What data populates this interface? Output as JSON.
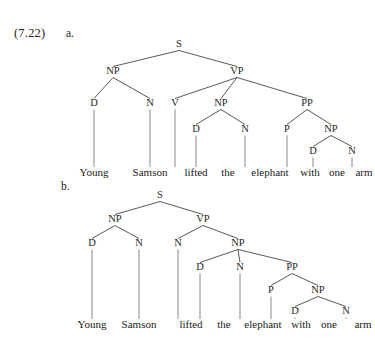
{
  "example": {
    "number_label": "(7.22)",
    "items": [
      {
        "letter": "a."
      },
      {
        "letter": "b."
      }
    ]
  },
  "sentence": {
    "words": [
      "Young",
      "Samson",
      "lifted",
      "the",
      "elephant",
      "with",
      "one",
      "arm"
    ]
  },
  "style": {
    "background": "#ffffff",
    "line_color": "#3b3b3b",
    "text_color": "#1f1f1f"
  },
  "trees": [
    {
      "id": "tree-a",
      "caption_letter": "a.",
      "description": "PP attached high to VP",
      "word_baseline_y": 158,
      "words": [
        {
          "text": "Young",
          "x": 94
        },
        {
          "text": "Samson",
          "x": 150
        },
        {
          "text": "lifted",
          "x": 196
        },
        {
          "text": "the",
          "x": 228
        },
        {
          "text": "elephant",
          "x": 270
        },
        {
          "text": "with",
          "x": 310
        },
        {
          "text": "one",
          "x": 337
        },
        {
          "text": "arm",
          "x": 364
        }
      ],
      "nodes": [
        {
          "id": "S",
          "label": "S",
          "x": 179,
          "y": 29
        },
        {
          "id": "NP1",
          "label": "NP",
          "x": 113,
          "y": 56
        },
        {
          "id": "VP",
          "label": "VP",
          "x": 237,
          "y": 56
        },
        {
          "id": "D1",
          "label": "D",
          "x": 94,
          "y": 88
        },
        {
          "id": "N1",
          "label": "N",
          "x": 150,
          "y": 88
        },
        {
          "id": "V",
          "label": "V",
          "x": 175,
          "y": 88
        },
        {
          "id": "NP2",
          "label": "NP",
          "x": 221,
          "y": 88
        },
        {
          "id": "PP",
          "label": "PP",
          "x": 307,
          "y": 88
        },
        {
          "id": "D2",
          "label": "D",
          "x": 196,
          "y": 114
        },
        {
          "id": "N2",
          "label": "N",
          "x": 245,
          "y": 114
        },
        {
          "id": "P",
          "label": "P",
          "x": 287,
          "y": 114
        },
        {
          "id": "NP3",
          "label": "NP",
          "x": 331,
          "y": 114
        },
        {
          "id": "D3",
          "label": "D",
          "x": 313,
          "y": 136
        },
        {
          "id": "N3",
          "label": "N",
          "x": 352,
          "y": 136
        }
      ],
      "edges": [
        [
          "S",
          "NP1"
        ],
        [
          "S",
          "VP"
        ],
        [
          "NP1",
          "D1"
        ],
        [
          "NP1",
          "N1"
        ],
        [
          "VP",
          "V"
        ],
        [
          "VP",
          "NP2"
        ],
        [
          "VP",
          "PP"
        ],
        [
          "NP2",
          "D2"
        ],
        [
          "NP2",
          "N2"
        ],
        [
          "PP",
          "P"
        ],
        [
          "PP",
          "NP3"
        ],
        [
          "NP3",
          "D3"
        ],
        [
          "NP3",
          "N3"
        ]
      ],
      "leaf_links": [
        {
          "from": "D1",
          "word_index": 0
        },
        {
          "from": "N1",
          "word_index": 1
        },
        {
          "from": "V",
          "word_index": 2
        },
        {
          "from": "D2",
          "word_index": 3
        },
        {
          "from": "N2",
          "word_index": 4
        },
        {
          "from": "P",
          "word_index": 5
        },
        {
          "from": "D3",
          "word_index": 6
        },
        {
          "from": "N3",
          "word_index": 7
        }
      ]
    },
    {
      "id": "tree-b",
      "caption_letter": "b.",
      "description": "PP attached low to object NP",
      "word_baseline_y": 146,
      "words": [
        {
          "text": "Young",
          "x": 92
        },
        {
          "text": "Samson",
          "x": 139
        },
        {
          "text": "lifted",
          "x": 191
        },
        {
          "text": "the",
          "x": 224
        },
        {
          "text": "elephant",
          "x": 263
        },
        {
          "text": "with",
          "x": 301
        },
        {
          "text": "one",
          "x": 329
        },
        {
          "text": "arm",
          "x": 363
        }
      ],
      "nodes": [
        {
          "id": "S",
          "label": "S",
          "x": 160,
          "y": 16
        },
        {
          "id": "NP1",
          "label": "NP",
          "x": 115,
          "y": 40
        },
        {
          "id": "VP",
          "label": "VP",
          "x": 203,
          "y": 40
        },
        {
          "id": "D1",
          "label": "D",
          "x": 92,
          "y": 64
        },
        {
          "id": "N1",
          "label": "N",
          "x": 139,
          "y": 64
        },
        {
          "id": "V",
          "label": "N",
          "x": 178,
          "y": 64
        },
        {
          "id": "NP2",
          "label": "NP",
          "x": 238,
          "y": 64
        },
        {
          "id": "D2",
          "label": "D",
          "x": 200,
          "y": 88
        },
        {
          "id": "N2",
          "label": "N",
          "x": 240,
          "y": 88
        },
        {
          "id": "PP",
          "label": "PP",
          "x": 292,
          "y": 88
        },
        {
          "id": "P",
          "label": "P",
          "x": 271,
          "y": 111
        },
        {
          "id": "NP3",
          "label": "NP",
          "x": 318,
          "y": 111
        },
        {
          "id": "D3",
          "label": "D",
          "x": 295,
          "y": 132
        },
        {
          "id": "N3",
          "label": "N",
          "x": 346,
          "y": 132
        }
      ],
      "edges": [
        [
          "S",
          "NP1"
        ],
        [
          "S",
          "VP"
        ],
        [
          "NP1",
          "D1"
        ],
        [
          "NP1",
          "N1"
        ],
        [
          "VP",
          "V"
        ],
        [
          "VP",
          "NP2"
        ],
        [
          "NP2",
          "D2"
        ],
        [
          "NP2",
          "N2"
        ],
        [
          "NP2",
          "PP"
        ],
        [
          "PP",
          "P"
        ],
        [
          "PP",
          "NP3"
        ],
        [
          "NP3",
          "D3"
        ],
        [
          "NP3",
          "N3"
        ]
      ],
      "leaf_links": [
        {
          "from": "D1",
          "word_index": 0
        },
        {
          "from": "N1",
          "word_index": 1
        },
        {
          "from": "V",
          "word_index": 2
        },
        {
          "from": "D2",
          "word_index": 3
        },
        {
          "from": "N2",
          "word_index": 4
        },
        {
          "from": "P",
          "word_index": 5
        },
        {
          "from": "D3",
          "word_index": 6
        },
        {
          "from": "N3",
          "word_index": 7
        }
      ]
    }
  ]
}
